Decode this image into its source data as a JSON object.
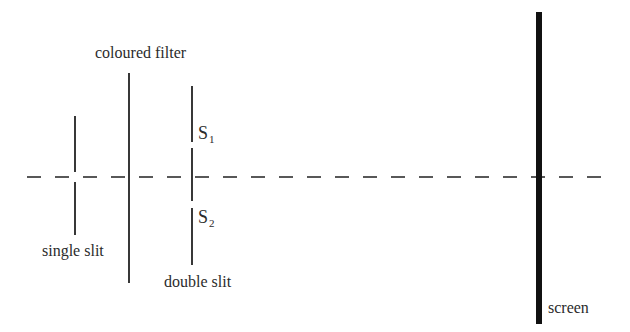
{
  "diagram": {
    "labels": {
      "filter": "coloured filter",
      "s1_main": "S",
      "s1_sub": "1",
      "s2_main": "S",
      "s2_sub": "2",
      "single_slit": "single slit",
      "double_slit": "double slit",
      "screen": "screen"
    },
    "colors": {
      "line": "#222222",
      "screen": "#111111",
      "background": "#ffffff"
    },
    "components": [
      {
        "name": "single slit",
        "x": 75
      },
      {
        "name": "coloured filter",
        "x": 129
      },
      {
        "name": "double slit",
        "x": 192,
        "slits": [
          "S1",
          "S2"
        ]
      },
      {
        "name": "screen",
        "x": 539
      }
    ]
  }
}
